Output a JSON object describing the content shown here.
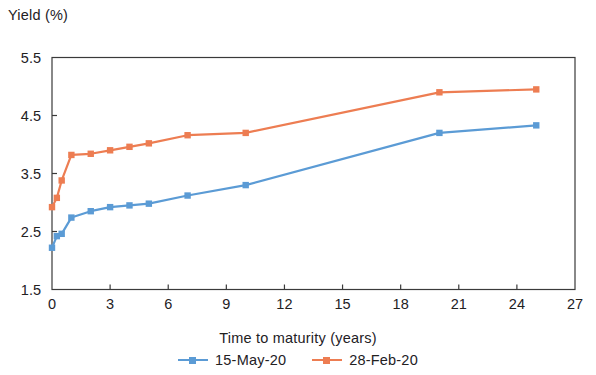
{
  "chart_data": {
    "type": "line",
    "title": "",
    "xlabel": "Time to maturity (years)",
    "ylabel": "Yield (%)",
    "xlim": [
      0,
      27
    ],
    "ylim": [
      1.5,
      5.5
    ],
    "xticks": [
      0,
      3,
      6,
      9,
      12,
      15,
      18,
      21,
      24,
      27
    ],
    "yticks": [
      1.5,
      2.5,
      3.5,
      4.5,
      5.5
    ],
    "xtick_labels": [
      "0",
      "3",
      "6",
      "9",
      "12",
      "15",
      "18",
      "21",
      "24",
      "27"
    ],
    "ytick_labels": [
      "1.5",
      "2.5",
      "3.5",
      "4.5",
      "5.5"
    ],
    "grid": false,
    "legend_position": "bottom",
    "series": [
      {
        "name": "15-May-20",
        "color": "#5B9BD5",
        "marker": "square",
        "x": [
          0,
          0.25,
          0.5,
          1,
          2,
          3,
          4,
          5,
          7,
          10,
          20,
          25
        ],
        "values": [
          2.22,
          2.42,
          2.46,
          2.74,
          2.85,
          2.92,
          2.95,
          2.98,
          3.12,
          3.3,
          4.2,
          4.33
        ]
      },
      {
        "name": "28-Feb-20",
        "color": "#ED7D52",
        "marker": "square",
        "x": [
          0,
          0.25,
          0.5,
          1,
          2,
          3,
          4,
          5,
          7,
          10,
          20,
          25
        ],
        "values": [
          2.92,
          3.08,
          3.38,
          3.82,
          3.84,
          3.9,
          3.96,
          4.02,
          4.16,
          4.2,
          4.9,
          4.95
        ]
      }
    ]
  },
  "legend": {
    "items": [
      {
        "label": "15-May-20",
        "color": "#5B9BD5"
      },
      {
        "label": "28-Feb-20",
        "color": "#ED7D52"
      }
    ]
  },
  "axes": {
    "frame_color": "#3a3a3a"
  }
}
